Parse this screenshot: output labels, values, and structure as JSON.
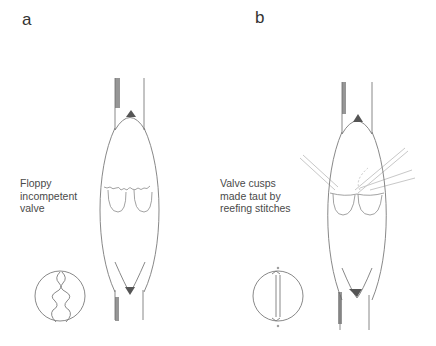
{
  "panels": [
    {
      "id": "a",
      "label": "a",
      "caption": "Floppy\nincompetent\nvalve",
      "state": "floppy"
    },
    {
      "id": "b",
      "label": "b",
      "caption": "Valve cusps\nmade taut by\nreefing stitches",
      "state": "repaired"
    }
  ],
  "colors": {
    "line": "#7a7a7a",
    "shade": "#555555",
    "stitch": "#bdbdbd",
    "text": "#444444"
  }
}
